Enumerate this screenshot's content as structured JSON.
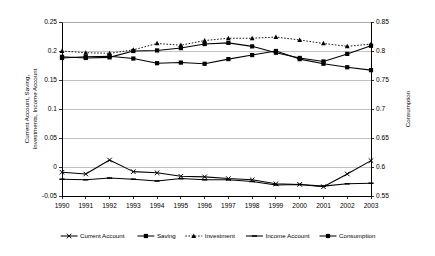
{
  "chart_data": {
    "type": "line",
    "title": "",
    "xlabel": "",
    "ylabel": "Current Account, Saving, Investments, Income Account",
    "ylabel_line1": "Current Account, Saving,",
    "ylabel_line2": "Investments, Income Account",
    "y2label": "Consumption",
    "categories": [
      "1990",
      "1991",
      "1992",
      "1993",
      "1994",
      "1995",
      "1996",
      "1997",
      "1998",
      "1999",
      "2000",
      "2001",
      "2002",
      "2003"
    ],
    "ylim": [
      -0.05,
      0.25
    ],
    "yticks": [
      "-0.05",
      "0",
      "0.05",
      "0.1",
      "0.15",
      "0.2",
      "0.25"
    ],
    "ytick_values": [
      -0.05,
      0,
      0.05,
      0.1,
      0.15,
      0.2,
      0.25
    ],
    "y2lim": [
      0.55,
      0.85
    ],
    "y2ticks": [
      "0.55",
      "0.6",
      "0.65",
      "0.7",
      "0.75",
      "0.8",
      "0.85"
    ],
    "y2tick_values": [
      0.55,
      0.6,
      0.65,
      0.7,
      0.75,
      0.8,
      0.85
    ],
    "grid": true,
    "legend_position": "bottom",
    "series": [
      {
        "name": "Current Account",
        "axis": "left",
        "marker": "cross",
        "dash": false,
        "values": [
          -0.009,
          -0.012,
          0.012,
          -0.008,
          -0.01,
          -0.016,
          -0.017,
          -0.02,
          -0.022,
          -0.029,
          -0.03,
          -0.034,
          -0.012,
          0.011
        ]
      },
      {
        "name": "Saving",
        "axis": "left",
        "marker": "square",
        "dash": false,
        "values": [
          0.19,
          0.188,
          0.189,
          0.2,
          0.201,
          0.205,
          0.212,
          0.214,
          0.208,
          0.197,
          0.188,
          0.182,
          0.195,
          0.209
        ]
      },
      {
        "name": "Investment",
        "axis": "left",
        "marker": "triangle",
        "dash": true,
        "values": [
          0.2,
          0.197,
          0.196,
          0.202,
          0.213,
          0.21,
          0.218,
          0.222,
          0.222,
          0.224,
          0.219,
          0.213,
          0.208,
          0.212
        ]
      },
      {
        "name": "Income Account",
        "axis": "left",
        "marker": "dash",
        "dash": false,
        "values": [
          -0.021,
          -0.022,
          -0.019,
          -0.021,
          -0.024,
          -0.02,
          -0.022,
          -0.022,
          -0.025,
          -0.031,
          -0.03,
          -0.033,
          -0.029,
          -0.028
        ]
      },
      {
        "name": "Consumption",
        "axis": "right",
        "marker": "square",
        "dash": false,
        "values": [
          0.788,
          0.79,
          0.791,
          0.787,
          0.779,
          0.78,
          0.778,
          0.786,
          0.793,
          0.8,
          0.786,
          0.778,
          0.772,
          0.767
        ]
      }
    ]
  }
}
